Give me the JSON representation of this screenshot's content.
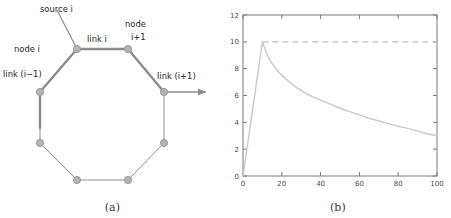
{
  "figure": {
    "panels": [
      {
        "id": "a",
        "caption": "(a)",
        "type": "diagram",
        "labels": {
          "source": "source i",
          "node_i": "node i",
          "link_i": "link i",
          "node_i_plus_1_line1": "node",
          "node_i_plus_1_line2": "i+1",
          "link_i_minus_1": "link (i−1)",
          "link_i_plus_1": "link (i+1)"
        },
        "colors": {
          "node_fill": "#b3b3b3",
          "node_stroke": "#9a9a9a",
          "edge_thick": "#8c8c8c",
          "edge_thin": "#8c8c8c",
          "text": "#231f20"
        },
        "node_count": 8,
        "nodes": [
          {
            "name": "node i",
            "x": 77,
            "y": 49
          },
          {
            "name": "node i+1",
            "x": 128,
            "y": 49
          },
          {
            "name": "node i+2",
            "x": 164,
            "y": 92
          },
          {
            "name": "node i+3",
            "x": 164,
            "y": 143
          },
          {
            "name": "node i+4",
            "x": 128,
            "y": 180
          },
          {
            "name": "node i+5",
            "x": 77,
            "y": 180
          },
          {
            "name": "node i+6",
            "x": 40,
            "y": 143
          },
          {
            "name": "node i+7",
            "x": 40,
            "y": 92
          }
        ]
      },
      {
        "id": "b",
        "caption": "(b)",
        "type": "chart"
      }
    ]
  },
  "chart_data": {
    "type": "line",
    "title": "",
    "xlabel": "",
    "ylabel": "",
    "xlim": [
      0,
      100
    ],
    "ylim": [
      0,
      12
    ],
    "grid": false,
    "legend": "none",
    "xticks": [
      0,
      20,
      40,
      60,
      80,
      100
    ],
    "xtick_labels": [
      "0",
      "20",
      "40",
      "60",
      "80",
      "100"
    ],
    "yticks": [
      0,
      2,
      4,
      6,
      8,
      10,
      12
    ],
    "ytick_labels": [
      "0",
      "2",
      "4",
      "6",
      "8",
      "10",
      "12"
    ],
    "series": [
      {
        "name": "response",
        "style": "solid",
        "color": "#c9c9c9",
        "x": [
          0,
          1,
          2,
          3,
          4,
          5,
          6,
          7,
          8,
          9,
          10,
          11,
          12,
          14,
          16,
          18,
          20,
          24,
          28,
          32,
          36,
          40,
          45,
          50,
          55,
          60,
          65,
          70,
          75,
          80,
          85,
          90,
          95,
          100
        ],
        "values": [
          0,
          1.0,
          2.0,
          3.0,
          4.0,
          5.0,
          6.0,
          7.0,
          8.0,
          9.0,
          10.0,
          9.6,
          9.2,
          8.6,
          8.2,
          7.8,
          7.5,
          7.0,
          6.55,
          6.2,
          5.9,
          5.65,
          5.35,
          5.05,
          4.8,
          4.55,
          4.3,
          4.1,
          3.9,
          3.7,
          3.55,
          3.35,
          3.15,
          3.0
        ]
      },
      {
        "name": "reference",
        "style": "dashed",
        "color": "#c0c0c0",
        "x": [
          10,
          100
        ],
        "values": [
          10,
          10
        ]
      }
    ],
    "axis_color": "#7a7a7a",
    "tick_label_color": "#4a4a4a"
  }
}
